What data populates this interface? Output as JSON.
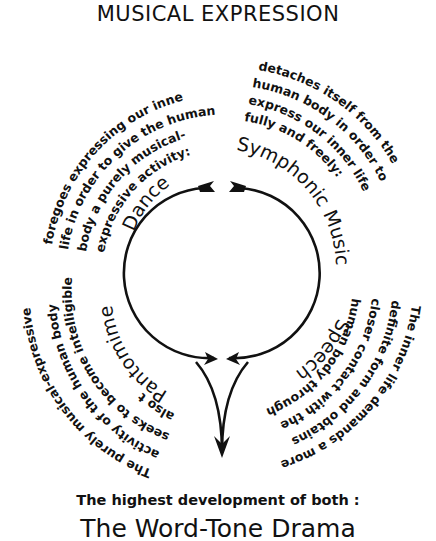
{
  "title": "MUSICAL EXPRESSION",
  "center": {
    "cx": 222,
    "cy": 275,
    "r": 83
  },
  "quadrants": {
    "dance": {
      "label": "Dance",
      "lines": [
        "foregoes expressing our inner",
        "life in order to give the human",
        "body a purely musical-",
        "expressive activity:"
      ]
    },
    "symphonic_music": {
      "label": "Symphonic Music",
      "lines": [
        "detaches itself from the",
        "human body in order to",
        "express our inner life",
        "fully and freely:"
      ]
    },
    "pantomime": {
      "label": "Pantomime",
      "lines": [
        "The purely musical-expressive",
        "activity of the human body",
        "seeks to become intelligible",
        "also through"
      ]
    },
    "speech": {
      "label": "Speech",
      "lines": [
        "The inner life demands a more",
        "definite form and obtains",
        "closer contact with the",
        "human body through"
      ]
    }
  },
  "caption": "The highest development of both :",
  "conclusion": "The Word-Tone Drama",
  "colors": {
    "ink": "#111111",
    "background": "#ffffff"
  }
}
